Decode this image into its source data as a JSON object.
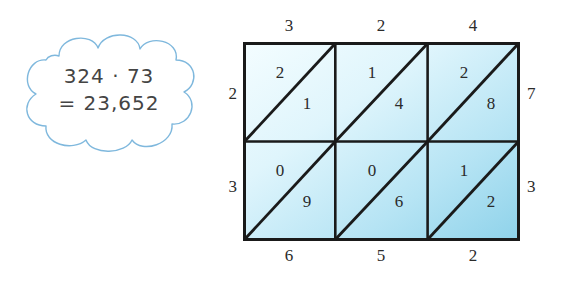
{
  "figure": {
    "kind": "lattice-multiplication-diagram",
    "callout": {
      "expression": "324 · 73",
      "result": "= 23,652"
    },
    "grid": {
      "columns": 3,
      "rows": 2,
      "top_labels": [
        "3",
        "2",
        "4"
      ],
      "right_labels": [
        "7",
        "3"
      ],
      "left_labels": [
        "2",
        "3"
      ],
      "bottom_labels": [
        "6",
        "5",
        "2"
      ],
      "cells": [
        {
          "row": 0,
          "col": 0,
          "upper": "2",
          "lower": "1"
        },
        {
          "row": 0,
          "col": 1,
          "upper": "1",
          "lower": "4"
        },
        {
          "row": 0,
          "col": 2,
          "upper": "2",
          "lower": "8"
        },
        {
          "row": 1,
          "col": 0,
          "upper": "0",
          "lower": "9"
        },
        {
          "row": 1,
          "col": 1,
          "upper": "0",
          "lower": "6"
        },
        {
          "row": 1,
          "col": 2,
          "upper": "1",
          "lower": "2"
        }
      ],
      "fill_light": "#f2fcfe",
      "fill_dark": "#8fd5ec",
      "border_color": "#1a1a1a"
    },
    "cloud": {
      "stroke_color": "#7fb8dd",
      "fill_color": "#ffffff"
    }
  }
}
